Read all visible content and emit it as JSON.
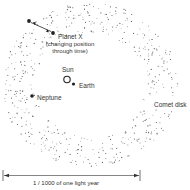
{
  "diagram": {
    "title": "",
    "labels": {
      "planet_x": "Planet X",
      "planet_x_note_1": "(changing position",
      "planet_x_note_2": "through time)",
      "sun": "Sun",
      "earth": "Earth",
      "neptune": "Neptune",
      "comet_disk": "Comet disk",
      "scale": "1 / 1000  of one light year"
    },
    "colors": {
      "ink": "#222222",
      "dots": "#555555",
      "background": "#ffffff"
    },
    "elements": {
      "sun": {
        "cx": 67,
        "cy": 80,
        "r": 3.2,
        "style": "hollow"
      },
      "earth": {
        "cx": 73,
        "cy": 84,
        "r": 1.6,
        "style": "filled"
      },
      "neptune": {
        "cx": 32,
        "cy": 96,
        "r": 1.8,
        "style": "filled"
      },
      "planet_x_start": {
        "cx": 29,
        "cy": 21,
        "r": 1.8
      },
      "planet_x_end": {
        "cx": 53,
        "cy": 33,
        "r": 1.8
      },
      "comet_disk": {
        "cx": 90,
        "cy": 85,
        "rx_outer": 88,
        "ry_outer": 82,
        "rx_inner": 55,
        "ry_inner": 52,
        "dot_count": 520
      },
      "scale_bar": {
        "x1": 4,
        "x2": 140,
        "y": 175
      }
    }
  }
}
